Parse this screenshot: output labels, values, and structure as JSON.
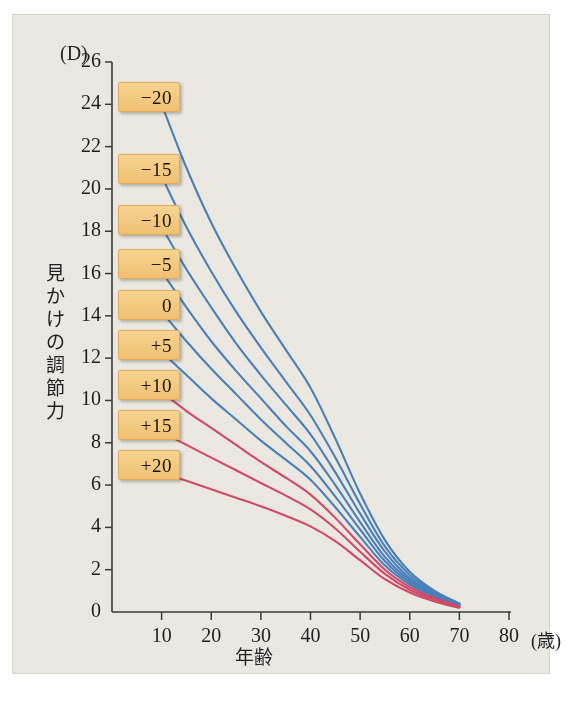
{
  "figure": {
    "unit_label": "(D)",
    "y_axis_title_chars": [
      "見",
      "か",
      "け",
      "の",
      "調",
      "節",
      "力"
    ],
    "x_axis_title": "年齢",
    "x_unit_label": "(歳)"
  },
  "colors": {
    "background": "#eceae3",
    "axis": "#3a3a3a",
    "blue_curve": "#4a81bb",
    "red_curve": "#d24a68",
    "label_box_fill": "#f3c679",
    "label_box_border": "#e0ae5d",
    "text": "#1f1f1f"
  },
  "chart_data": {
    "type": "line",
    "title": "",
    "subtitle": "",
    "xlabel": "年齢",
    "ylabel": "見かけの調節力",
    "x_unit": "(歳)",
    "y_unit": "(D)",
    "xlim": [
      0,
      80
    ],
    "ylim": [
      0,
      26
    ],
    "x_ticks": [
      10,
      20,
      30,
      40,
      50,
      60,
      70,
      80
    ],
    "y_ticks": [
      0,
      2,
      4,
      6,
      8,
      10,
      12,
      14,
      16,
      18,
      20,
      22,
      24,
      26
    ],
    "grid": false,
    "legend_position": "inline-left-labels",
    "x": [
      10,
      15,
      20,
      25,
      30,
      35,
      40,
      45,
      50,
      55,
      60,
      65,
      70
    ],
    "series": [
      {
        "name": "-20",
        "label": "−20",
        "color": "#4a81bb",
        "values": [
          24.0,
          21.0,
          18.4,
          16.2,
          14.2,
          12.4,
          10.6,
          8.2,
          5.6,
          3.4,
          1.9,
          1.0,
          0.4
        ]
      },
      {
        "name": "-15",
        "label": "−15",
        "color": "#4a81bb",
        "values": [
          20.6,
          18.2,
          16.1,
          14.2,
          12.5,
          10.9,
          9.3,
          7.3,
          5.1,
          3.1,
          1.75,
          0.95,
          0.38
        ]
      },
      {
        "name": "-10",
        "label": "−10",
        "color": "#4a81bb",
        "values": [
          18.2,
          16.2,
          14.4,
          12.7,
          11.2,
          9.8,
          8.4,
          6.6,
          4.65,
          2.85,
          1.6,
          0.9,
          0.36
        ]
      },
      {
        "name": "-5",
        "label": "−5",
        "color": "#4a81bb",
        "values": [
          16.1,
          14.4,
          12.8,
          11.4,
          10.1,
          8.8,
          7.6,
          6.0,
          4.25,
          2.6,
          1.5,
          0.85,
          0.34
        ]
      },
      {
        "name": "0",
        "label": "0",
        "color": "#4a81bb",
        "values": [
          14.2,
          12.8,
          11.5,
          10.3,
          9.1,
          8.0,
          6.9,
          5.45,
          3.9,
          2.4,
          1.4,
          0.8,
          0.32
        ]
      },
      {
        "name": "+5",
        "label": "+5",
        "color": "#4a81bb",
        "values": [
          12.3,
          11.2,
          10.1,
          9.1,
          8.1,
          7.2,
          6.25,
          4.95,
          3.55,
          2.2,
          1.3,
          0.72,
          0.3
        ]
      },
      {
        "name": "+10",
        "label": "+10",
        "color": "#d24a68",
        "values": [
          10.4,
          9.5,
          8.7,
          7.9,
          7.1,
          6.35,
          5.55,
          4.45,
          3.2,
          2.0,
          1.18,
          0.65,
          0.26
        ]
      },
      {
        "name": "+15",
        "label": "+15",
        "color": "#d24a68",
        "values": [
          8.5,
          7.9,
          7.3,
          6.7,
          6.1,
          5.5,
          4.85,
          3.95,
          2.85,
          1.8,
          1.05,
          0.58,
          0.23
        ]
      },
      {
        "name": "+20",
        "label": "+20",
        "color": "#d24a68",
        "values": [
          6.6,
          6.2,
          5.8,
          5.4,
          5.0,
          4.55,
          4.05,
          3.35,
          2.45,
          1.55,
          0.92,
          0.5,
          0.2
        ]
      }
    ],
    "curve_labels": [
      {
        "text": "−20",
        "y_value": 24
      },
      {
        "text": "−15",
        "y_value": 20.6
      },
      {
        "text": "−10",
        "y_value": 18.2
      },
      {
        "text": "−5",
        "y_value": 16.1
      },
      {
        "text": "0",
        "y_value": 14.2
      },
      {
        "text": "+5",
        "y_value": 12.3
      },
      {
        "text": "+10",
        "y_value": 10.4
      },
      {
        "text": "+15",
        "y_value": 8.5
      },
      {
        "text": "+20",
        "y_value": 6.6
      }
    ]
  }
}
